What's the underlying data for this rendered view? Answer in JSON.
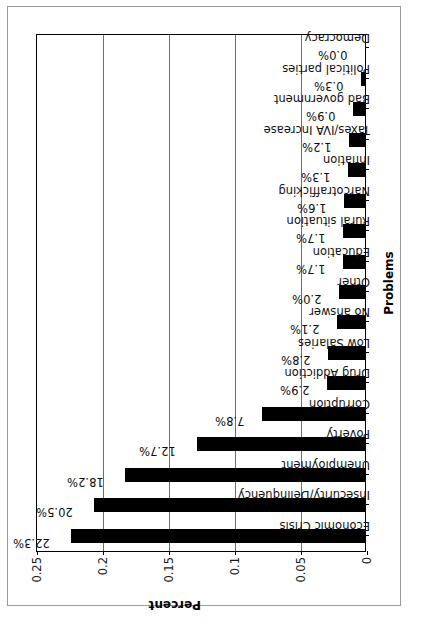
{
  "chart_data": {
    "type": "bar",
    "title": "",
    "xlabel": "Problems",
    "ylabel": "Percent",
    "ylim": [
      0,
      0.25
    ],
    "grid": true,
    "legend": "none",
    "orientation": "vertical-bars-rotated-90",
    "ytick_labels": [
      "0",
      "0.05",
      "0.1",
      "0.15",
      "0.2",
      "0.25"
    ],
    "ytick_values": [
      0,
      0.05,
      0.1,
      0.15,
      0.2,
      0.25
    ],
    "categories": [
      "Economic Crisis",
      "Insecurity/Delinquency",
      "Unemployment",
      "Poverty",
      "Corruption",
      "Drug Addiction",
      "Low Salaries",
      "No answer",
      "Other",
      "Education",
      "Rural situation",
      "Narcotrafficking",
      "Inflation",
      "Taxes/IVA Increase",
      "Bad government",
      "Political parties",
      "Democracy"
    ],
    "values": [
      0.223,
      0.205,
      0.182,
      0.127,
      0.078,
      0.029,
      0.028,
      0.021,
      0.02,
      0.017,
      0.017,
      0.016,
      0.013,
      0.012,
      0.009,
      0.003,
      0.0
    ],
    "data_labels": [
      "22.3%",
      "20.5%",
      "18.2%",
      "12.7%",
      "7.8%",
      "2.9%",
      "2.8%",
      "2.1%",
      "2.0%",
      "1.7%",
      "1.7%",
      "1.6%",
      "1.3%",
      "1.2%",
      "0.9%",
      "0.3%",
      "0.0%"
    ],
    "bar_color": "#000000",
    "grid_color": "#6e6e6e",
    "axis_color": "#000000",
    "background": "#ffffff"
  }
}
